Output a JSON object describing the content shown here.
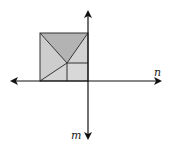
{
  "diagram": {
    "labels": {
      "horizontal_axis": "n",
      "vertical_axis": "m"
    },
    "colors": {
      "top_triangle": "#b3b3b3",
      "left_triangle": "#cdcdcd",
      "right_triangle": "#d2d2d2",
      "small_rect": "#d8d8d8",
      "bottom_quad": "#d4d4d4",
      "line": "#333333"
    },
    "square": {
      "left": 40,
      "top": 33,
      "right": 88,
      "bottom": 81,
      "inner_point": [
        67,
        63
      ]
    }
  }
}
